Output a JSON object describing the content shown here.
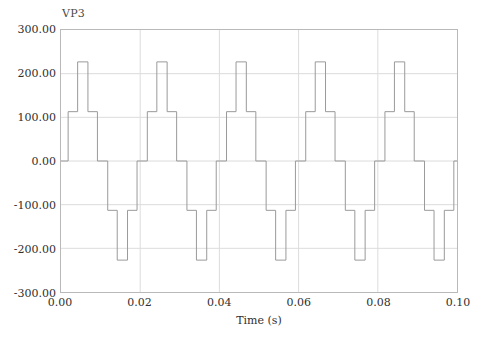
{
  "figure": {
    "background_color": "#ffffff",
    "frame_color": "#b9b9b9",
    "grid_color": "#dcdcdc",
    "trace_color": "#9a9a9a"
  },
  "series_label": "VP3",
  "axes": {
    "x_title": "Time (s)",
    "y_title": "",
    "x_ticks": [
      "0.00",
      "0.02",
      "0.04",
      "0.06",
      "0.08",
      "0.10"
    ],
    "y_ticks": [
      "300.00",
      "200.00",
      "100.00",
      "0.00",
      "-100.00",
      "-200.00",
      "-300.00"
    ]
  },
  "chart_data": {
    "type": "line",
    "title": "",
    "subtitle": "",
    "xlabel": "Time (s)",
    "ylabel": "",
    "xlim": [
      0.0,
      0.1
    ],
    "ylim": [
      -300.0,
      300.0
    ],
    "xticks": [
      0.0,
      0.02,
      0.04,
      0.06,
      0.08,
      0.1
    ],
    "yticks": [
      -300,
      -200,
      -100,
      0,
      100,
      200,
      300
    ],
    "grid": true,
    "legend": null,
    "legend_position": "above-top-left",
    "series": [
      {
        "name": "VP3",
        "color": "#9a9a9a",
        "style": "step-post",
        "description": "Three-level staircase inverter phase voltage, 50 Hz, peak 227 V, intermediate level 113 V",
        "period": 0.02,
        "levels": [
          0,
          113,
          227,
          113,
          0,
          -113,
          -227,
          -113
        ],
        "x": [
          0.0,
          0.0018,
          0.0042,
          0.0068,
          0.0092,
          0.0118,
          0.0142,
          0.0168,
          0.0192,
          0.02,
          0.0218,
          0.0242,
          0.0268,
          0.0292,
          0.0318,
          0.0342,
          0.0368,
          0.0392,
          0.04,
          0.0418,
          0.0442,
          0.0468,
          0.0492,
          0.0518,
          0.0542,
          0.0568,
          0.0592,
          0.06,
          0.0618,
          0.0642,
          0.0668,
          0.0692,
          0.0718,
          0.0742,
          0.0768,
          0.0792,
          0.08,
          0.0818,
          0.0842,
          0.0868,
          0.0892,
          0.0918,
          0.0942,
          0.0968,
          0.0992,
          0.1
        ],
        "y": [
          0,
          113,
          227,
          113,
          0,
          -113,
          -227,
          -113,
          0,
          0,
          113,
          227,
          113,
          0,
          -113,
          -227,
          -113,
          0,
          0,
          113,
          227,
          113,
          0,
          -113,
          -227,
          -113,
          0,
          0,
          113,
          227,
          113,
          0,
          -113,
          -227,
          -113,
          0,
          0,
          113,
          227,
          113,
          0,
          -113,
          -227,
          -113,
          0,
          0
        ]
      }
    ]
  }
}
